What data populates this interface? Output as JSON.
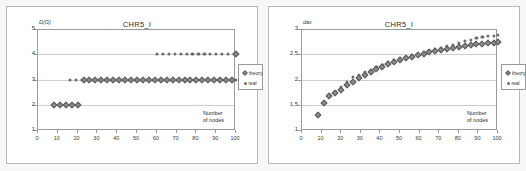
{
  "figure": {
    "panels": [
      {
        "id": "left",
        "title": "CHR5_I",
        "ylabel": "D(G)",
        "xcaption_line1": "Number",
        "xcaption_line2": "of nodes",
        "legend": [
          {
            "name": "theory",
            "marker": "diamond"
          },
          {
            "name": "real",
            "marker": "dot"
          }
        ]
      },
      {
        "id": "right",
        "title": "CHR5_I",
        "ylabel": "dav",
        "xcaption_line1": "Number",
        "xcaption_line2": "of nodes",
        "legend": [
          {
            "name": "theory",
            "marker": "diamond"
          },
          {
            "name": "real",
            "marker": "dot"
          }
        ]
      }
    ]
  },
  "chart_data": [
    {
      "type": "scatter",
      "title": "CHR5_I",
      "xlabel": "Number of nodes",
      "ylabel": "D(G)",
      "xlim": [
        0,
        100
      ],
      "ylim": [
        1,
        5
      ],
      "xticks": [
        "0",
        "10",
        "20",
        "30",
        "40",
        "50",
        "60",
        "70",
        "80",
        "90",
        "100"
      ],
      "yticks": [
        "1",
        "2",
        "3",
        "4",
        "5"
      ],
      "grid": true,
      "legend_position": "right-outside",
      "series": [
        {
          "name": "theory",
          "marker": "diamond",
          "color": "#8d8d8d",
          "x": [
            8,
            11,
            14,
            17,
            20,
            23,
            26,
            29,
            32,
            35,
            38,
            41,
            44,
            47,
            50,
            53,
            56,
            59,
            62,
            65,
            68,
            71,
            74,
            77,
            80,
            83,
            86,
            89,
            92,
            95,
            98,
            100
          ],
          "y": [
            2,
            2,
            2,
            2,
            2,
            3,
            3,
            3,
            3,
            3,
            3,
            3,
            3,
            3,
            3,
            3,
            3,
            3,
            3,
            3,
            3,
            3,
            3,
            3,
            3,
            3,
            3,
            3,
            3,
            3,
            3,
            4
          ]
        },
        {
          "name": "real",
          "marker": "dot",
          "color": "#6b6b6b",
          "x": [
            8,
            11,
            14,
            16,
            19,
            22,
            25,
            28,
            31,
            34,
            37,
            40,
            43,
            46,
            49,
            52,
            55,
            58,
            61,
            64,
            67,
            70,
            73,
            76,
            79,
            82,
            85,
            88,
            91,
            94,
            97,
            100,
            60,
            63,
            66,
            69,
            72,
            75,
            78,
            81,
            84,
            87,
            90,
            93,
            96,
            99
          ],
          "y": [
            2,
            2,
            2,
            3,
            3,
            3,
            3,
            3,
            3,
            3,
            3,
            3,
            3,
            3,
            3,
            3,
            3,
            3,
            3,
            3,
            3,
            3,
            3,
            3,
            3,
            3,
            3,
            3,
            3,
            3,
            3,
            3,
            4,
            4,
            4,
            4,
            4,
            4,
            4,
            4,
            4,
            4,
            4,
            4,
            4,
            4
          ]
        }
      ]
    },
    {
      "type": "scatter",
      "title": "CHR5_I",
      "xlabel": "Number of nodes",
      "ylabel": "dav",
      "xlim": [
        0,
        100
      ],
      "ylim": [
        1,
        3
      ],
      "xticks": [
        "0",
        "10",
        "20",
        "30",
        "40",
        "50",
        "60",
        "70",
        "80",
        "90",
        "100"
      ],
      "yticks": [
        "1",
        "1,5",
        "2",
        "2,5",
        "3"
      ],
      "grid": true,
      "legend_position": "right-outside",
      "series": [
        {
          "name": "theory",
          "marker": "diamond",
          "color": "#8d8d8d",
          "x": [
            8,
            11,
            14,
            17,
            20,
            23,
            26,
            29,
            32,
            35,
            38,
            41,
            44,
            47,
            50,
            53,
            56,
            59,
            62,
            65,
            68,
            71,
            74,
            77,
            80,
            83,
            86,
            89,
            92,
            95,
            98,
            100
          ],
          "y": [
            1.29,
            1.54,
            1.67,
            1.73,
            1.8,
            1.89,
            1.96,
            2.03,
            2.09,
            2.15,
            2.2,
            2.25,
            2.3,
            2.34,
            2.38,
            2.42,
            2.45,
            2.48,
            2.51,
            2.54,
            2.57,
            2.59,
            2.61,
            2.63,
            2.65,
            2.67,
            2.68,
            2.7,
            2.71,
            2.72,
            2.73,
            2.74
          ]
        },
        {
          "name": "real",
          "marker": "dot",
          "color": "#6b6b6b",
          "x": [
            8,
            11,
            14,
            17,
            20,
            23,
            26,
            29,
            32,
            35,
            38,
            41,
            44,
            47,
            50,
            53,
            56,
            59,
            62,
            65,
            68,
            71,
            74,
            77,
            80,
            83,
            86,
            89,
            92,
            95,
            98,
            100
          ],
          "y": [
            1.29,
            1.55,
            1.69,
            1.76,
            1.86,
            1.95,
            2.05,
            2.08,
            2.14,
            2.19,
            2.24,
            2.29,
            2.34,
            2.38,
            2.42,
            2.45,
            2.48,
            2.51,
            2.54,
            2.57,
            2.6,
            2.63,
            2.66,
            2.69,
            2.72,
            2.76,
            2.79,
            2.82,
            2.84,
            2.86,
            2.87,
            2.88
          ]
        }
      ]
    }
  ]
}
